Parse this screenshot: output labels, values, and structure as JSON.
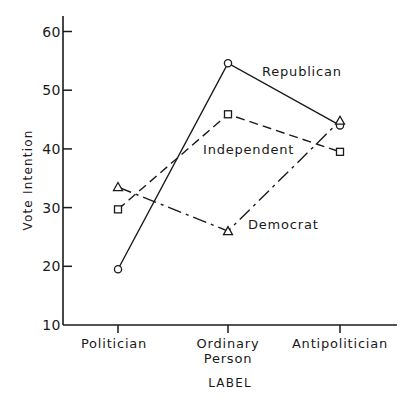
{
  "chart_data": {
    "type": "line",
    "title": "",
    "xlabel": "LABEL",
    "ylabel": "Vote Intention",
    "categories": [
      "Politician",
      "Ordinary Person",
      "Antipolitician"
    ],
    "category_lines": [
      [
        "Politician"
      ],
      [
        "Ordinary",
        "Person"
      ],
      [
        "Antipolitician"
      ]
    ],
    "y_ticks": [
      10,
      20,
      30,
      40,
      50,
      60
    ],
    "ylim": [
      10,
      62
    ],
    "grid": false,
    "legend": "inline labels",
    "series": [
      {
        "name": "Republican",
        "marker": "circle",
        "line": "solid",
        "values": [
          19.5,
          54.6,
          44.0
        ]
      },
      {
        "name": "Independent",
        "marker": "square",
        "line": "dashed",
        "values": [
          29.7,
          45.9,
          39.5
        ]
      },
      {
        "name": "Democrat",
        "marker": "triangle",
        "line": "dash-dot",
        "values": [
          33.5,
          26.0,
          44.8
        ]
      }
    ]
  }
}
